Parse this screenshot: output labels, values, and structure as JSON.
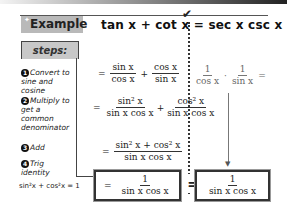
{
  "header": {
    "badge_label": "Example",
    "sparkle": "✦",
    "equation_left": "tan x + cot x",
    "equals": "=",
    "equation_right": "sec x csc x",
    "check_mark": "✔"
  },
  "steps_label": "steps:",
  "steps": [
    {
      "num": "1",
      "text": "Convert to sine and cosine"
    },
    {
      "num": "2",
      "text": "Multiply to get a common denominator"
    },
    {
      "num": "3",
      "text": "Add"
    },
    {
      "num": "4",
      "text": "Trig identity"
    }
  ],
  "identity": "sin²x + cos²x = 1",
  "left_side": {
    "row1": {
      "eq": "=",
      "f1_num": "sin x",
      "f1_den": "cos x",
      "plus": "+",
      "f2_num": "cos x",
      "f2_den": "sin x"
    },
    "row2": {
      "eq": "=",
      "f1_num": "sin² x",
      "f1_den": "sin x cos x",
      "plus": "+",
      "f2_num": "cos² x",
      "f2_den": "sin x cos x"
    },
    "row3": {
      "eq": "=",
      "num": "sin² x + cos² x",
      "den": "sin x  cos x"
    },
    "row4": {
      "eq": "=",
      "num": "1",
      "den": "sin x  cos x"
    }
  },
  "right_side": {
    "row1": {
      "f1_num": "1",
      "f1_den": "cos x",
      "times": "·",
      "f2_num": "1",
      "f2_den": "sin x",
      "eq": "="
    },
    "result": {
      "num": "1",
      "den": "sin x  cos x"
    },
    "arrow": "▼"
  },
  "big_equals": "="
}
